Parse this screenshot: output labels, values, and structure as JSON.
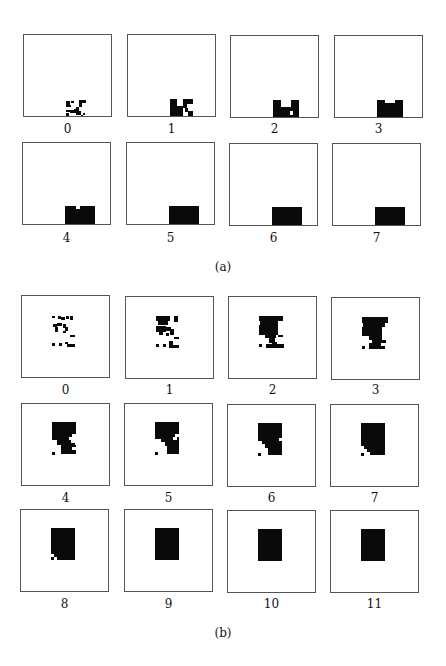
{
  "figure": {
    "parts": [
      {
        "caption": "(a)",
        "panels": [
          {
            "label": "0",
            "blocks": [
              [
                42,
                66,
                4,
                4
              ],
              [
                47,
                66,
                3,
                2
              ],
              [
                42,
                70,
                5,
                2
              ],
              [
                55,
                65,
                7,
                3
              ],
              [
                55,
                68,
                3,
                4
              ],
              [
                42,
                75,
                4,
                2
              ],
              [
                46,
                75,
                4,
                3
              ],
              [
                42,
                78,
                3,
                5
              ],
              [
                50,
                74,
                3,
                4
              ],
              [
                52,
                72,
                3,
                8
              ],
              [
                54,
                76,
                3,
                4
              ],
              [
                55,
                82,
                2,
                2
              ],
              [
                57,
                80,
                2,
                2
              ],
              [
                59,
                78,
                2,
                2
              ],
              [
                59,
                82,
                2,
                2
              ]
            ]
          },
          {
            "label": "1",
            "blocks": [
              [
                42,
                64,
                7,
                20
              ],
              [
                49,
                71,
                6,
                10
              ],
              [
                45,
                80,
                4,
                4
              ],
              [
                55,
                64,
                10,
                5
              ],
              [
                55,
                69,
                4,
                4
              ],
              [
                57,
                73,
                3,
                4
              ],
              [
                60,
                76,
                5,
                8
              ]
            ]
          },
          {
            "label": "2",
            "blocks": [
              [
                42,
                64,
                8,
                23
              ],
              [
                50,
                71,
                10,
                13
              ],
              [
                60,
                64,
                8,
                23
              ],
              [
                59,
                75,
                4,
                5
              ]
            ],
            "holes": [
              [
                59,
                75,
                3,
                4
              ]
            ]
          },
          {
            "label": "3",
            "blocks": [
              [
                42,
                64,
                8,
                23
              ],
              [
                50,
                67,
                10,
                18
              ],
              [
                60,
                64,
                8,
                23
              ]
            ]
          },
          {
            "label": "4",
            "blocks": [
              [
                42,
                63,
                30,
                22
              ]
            ],
            "holes": [
              [
                53,
                63,
                4,
                3
              ],
              [
                53,
                82,
                4,
                3
              ]
            ]
          },
          {
            "label": "5",
            "blocks": [
              [
                42,
                63,
                30,
                22
              ]
            ]
          },
          {
            "label": "6",
            "blocks": [
              [
                42,
                63,
                30,
                22
              ]
            ]
          },
          {
            "label": "7",
            "blocks": [
              [
                42,
                63,
                30,
                22
              ]
            ]
          }
        ]
      },
      {
        "caption": "(b)",
        "panels": [
          {
            "label": "0",
            "blocks": [
              [
                30,
                20,
                3,
                2
              ],
              [
                36,
                20,
                3,
                3
              ],
              [
                39,
                21,
                4,
                3
              ],
              [
                44,
                20,
                3,
                3
              ],
              [
                48,
                20,
                3,
                4
              ],
              [
                31,
                28,
                4,
                3
              ],
              [
                35,
                27,
                5,
                3
              ],
              [
                33,
                31,
                3,
                5
              ],
              [
                41,
                28,
                3,
                4
              ],
              [
                43,
                31,
                3,
                4
              ],
              [
                41,
                35,
                3,
                2
              ],
              [
                48,
                39,
                5,
                2
              ],
              [
                30,
                47,
                3,
                3
              ],
              [
                37,
                47,
                3,
                3
              ],
              [
                43,
                46,
                3,
                2
              ],
              [
                45,
                48,
                8,
                3
              ]
            ]
          },
          {
            "label": "1",
            "blocks": [
              [
                30,
                19,
                14,
                5
              ],
              [
                32,
                24,
                10,
                4
              ],
              [
                48,
                19,
                4,
                6
              ],
              [
                30,
                29,
                10,
                6
              ],
              [
                33,
                35,
                4,
                3
              ],
              [
                40,
                30,
                5,
                4
              ],
              [
                44,
                32,
                4,
                6
              ],
              [
                40,
                36,
                3,
                3
              ],
              [
                48,
                40,
                5,
                2
              ],
              [
                30,
                47,
                3,
                3
              ],
              [
                37,
                47,
                3,
                3
              ],
              [
                43,
                44,
                4,
                7
              ],
              [
                47,
                48,
                6,
                3
              ]
            ]
          },
          {
            "label": "2",
            "blocks": [
              [
                30,
                19,
                24,
                5
              ],
              [
                31,
                24,
                18,
                4
              ],
              [
                30,
                28,
                19,
                10
              ],
              [
                36,
                38,
                11,
                3
              ],
              [
                40,
                41,
                6,
                5
              ],
              [
                43,
                45,
                5,
                3
              ],
              [
                49,
                38,
                5,
                2
              ],
              [
                30,
                47,
                3,
                3
              ],
              [
                37,
                47,
                18,
                4
              ]
            ]
          },
          {
            "label": "3",
            "blocks": [
              [
                30,
                19,
                26,
                6
              ],
              [
                31,
                25,
                22,
                4
              ],
              [
                30,
                29,
                20,
                9
              ],
              [
                37,
                38,
                13,
                4
              ],
              [
                40,
                42,
                14,
                3
              ],
              [
                37,
                45,
                12,
                3
              ],
              [
                37,
                48,
                16,
                3
              ],
              [
                30,
                48,
                3,
                3
              ]
            ]
          },
          {
            "label": "4",
            "blocks": [
              [
                30,
                18,
                24,
                12
              ],
              [
                30,
                30,
                20,
                6
              ],
              [
                35,
                36,
                18,
                5
              ],
              [
                39,
                41,
                15,
                7
              ],
              [
                30,
                48,
                3,
                3
              ],
              [
                39,
                48,
                15,
                2
              ]
            ],
            "holes": [
              [
                50,
                30,
                4,
                3
              ],
              [
                47,
                33,
                4,
                3
              ],
              [
                49,
                36,
                4,
                3
              ],
              [
                50,
                43,
                4,
                3
              ]
            ]
          },
          {
            "label": "5",
            "blocks": [
              [
                30,
                18,
                24,
                32
              ],
              [
                30,
                48,
                3,
                3
              ]
            ],
            "holes": [
              [
                50,
                30,
                4,
                3
              ],
              [
                48,
                33,
                4,
                3
              ],
              [
                26,
                35,
                10,
                18
              ],
              [
                36,
                38,
                4,
                12
              ],
              [
                40,
                42,
                2,
                8
              ]
            ]
          },
          {
            "label": "6",
            "blocks": [
              [
                30,
                18,
                24,
                32
              ],
              [
                30,
                48,
                3,
                3
              ]
            ],
            "holes": [
              [
                51,
                33,
                3,
                3
              ],
              [
                26,
                36,
                8,
                18
              ],
              [
                34,
                39,
                3,
                12
              ],
              [
                37,
                43,
                3,
                8
              ]
            ]
          },
          {
            "label": "7",
            "blocks": [
              [
                30,
                18,
                24,
                32
              ],
              [
                30,
                48,
                3,
                3
              ]
            ],
            "holes": [
              [
                26,
                41,
                7,
                12
              ],
              [
                33,
                44,
                3,
                9
              ],
              [
                36,
                47,
                3,
                6
              ]
            ]
          },
          {
            "label": "8",
            "blocks": [
              [
                30,
                18,
                24,
                32
              ],
              [
                30,
                47,
                3,
                3
              ]
            ],
            "holes": [
              [
                30,
                44,
                3,
                3
              ],
              [
                33,
                47,
                3,
                3
              ]
            ]
          },
          {
            "label": "9",
            "blocks": [
              [
                30,
                18,
                24,
                32
              ]
            ]
          },
          {
            "label": "10",
            "blocks": [
              [
                30,
                18,
                24,
                32
              ]
            ]
          },
          {
            "label": "11",
            "blocks": [
              [
                30,
                18,
                24,
                32
              ]
            ]
          }
        ]
      }
    ]
  }
}
